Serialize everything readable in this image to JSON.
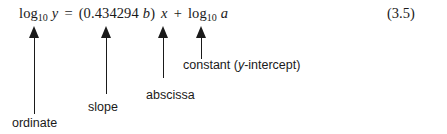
{
  "figure": {
    "equation_number": "(3.5)",
    "equation": {
      "lhs_log": "log",
      "lhs_sub": "10",
      "lhs_var": "y",
      "equals": "=",
      "open_paren": "(",
      "coefficient": "0.434294",
      "coeff_var": "b",
      "close_paren": ")",
      "x_var": "x",
      "plus": "+",
      "rhs_log": "log",
      "rhs_sub": "10",
      "rhs_var": "a",
      "plain_text": "log10 y = (0.434294 b) x + log10 a"
    },
    "annotations": [
      {
        "id": "ordinate",
        "label": "ordinate",
        "target": "log10 y"
      },
      {
        "id": "slope",
        "label": "slope",
        "target": "0.434294 b"
      },
      {
        "id": "abscissa",
        "label": "abscissa",
        "target": "x"
      },
      {
        "id": "constant",
        "label_prefix": "constant (",
        "label_var": "y",
        "label_suffix": "-intercept)",
        "target": "log10 a"
      }
    ]
  }
}
